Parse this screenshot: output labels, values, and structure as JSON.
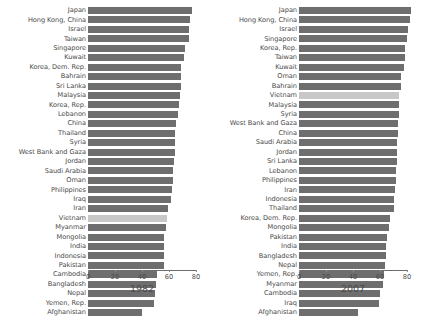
{
  "figure": {
    "panels": [
      {
        "id": "1982",
        "name": "panel-1982",
        "year_label": "1982",
        "axis": {
          "ticks": [
            "0",
            "20",
            "40",
            "60",
            "80"
          ],
          "tick_values": [
            0,
            20,
            40,
            60,
            80
          ],
          "xlim": [
            0,
            80
          ]
        },
        "highlight_country": "Vietnam"
      },
      {
        "id": "2007",
        "name": "panel-2007",
        "year_label": "2007",
        "axis": {
          "ticks": [
            "0",
            "20",
            "40",
            "60",
            "80"
          ],
          "tick_values": [
            0,
            20,
            40,
            60,
            80
          ],
          "xlim": [
            0,
            80
          ]
        },
        "highlight_country": "Vietnam"
      }
    ]
  },
  "colors": {
    "bar": "#6e6e6e",
    "bar_highlight": "#c8c8c8",
    "text": "#4a4a4a",
    "axis": "#6e6e6e",
    "background": "#ffffff"
  },
  "chart_data": [
    {
      "type": "bar",
      "orientation": "horizontal",
      "title": "1982",
      "xlabel": "",
      "ylabel": "",
      "xlim": [
        0,
        80
      ],
      "xticks": [
        0,
        20,
        40,
        60,
        80
      ],
      "grid": false,
      "legend": null,
      "highlighted": [
        "Vietnam"
      ],
      "categories": [
        "Japan",
        "Hong Kong, China",
        "Israel",
        "Taiwan",
        "Singapore",
        "Kuwait",
        "Korea, Dem. Rep.",
        "Bahrain",
        "Sri Lanka",
        "Malaysia",
        "Korea, Rep.",
        "Lebanon",
        "China",
        "Thailand",
        "Syria",
        "West Bank and Gaza",
        "Jordan",
        "Saudi Arabia",
        "Oman",
        "Philippines",
        "Iraq",
        "Iran",
        "Vietnam",
        "Myanmar",
        "Mongolia",
        "India",
        "Indonesia",
        "Pakistan",
        "Cambodia",
        "Bangladesh",
        "Nepal",
        "Yemen, Rep.",
        "Afghanistan"
      ],
      "values": [
        77.1,
        75.4,
        74.9,
        74.6,
        71.8,
        71.3,
        69.1,
        68.7,
        68.8,
        68.0,
        67.1,
        66.9,
        65.5,
        64.6,
        64.6,
        64.4,
        63.7,
        63.0,
        62.7,
        62.1,
        61.4,
        59.6,
        58.8,
        58.1,
        56.6,
        56.6,
        56.2,
        56.2,
        50.9,
        50.0,
        49.6,
        49.1,
        39.9
      ]
    },
    {
      "type": "bar",
      "orientation": "horizontal",
      "title": "2007",
      "xlabel": "",
      "ylabel": "",
      "xlim": [
        0,
        80
      ],
      "xticks": [
        0,
        20,
        40,
        60,
        80
      ],
      "grid": false,
      "legend": null,
      "highlighted": [
        "Vietnam"
      ],
      "categories": [
        "Japan",
        "Hong Kong, China",
        "Israel",
        "Singapore",
        "Korea, Rep.",
        "Taiwan",
        "Kuwait",
        "Oman",
        "Bahrain",
        "Vietnam",
        "Malaysia",
        "Syria",
        "West Bank and Gaza",
        "China",
        "Saudi Arabia",
        "Jordan",
        "Sri Lanka",
        "Lebanon",
        "Philippines",
        "Iran",
        "Indonesia",
        "Thailand",
        "Korea, Dem. Rep.",
        "Mongolia",
        "Pakistan",
        "India",
        "Bangladesh",
        "Nepal",
        "Yemen, Rep.",
        "Myanmar",
        "Cambodia",
        "Iraq",
        "Afghanistan"
      ],
      "values": [
        82.6,
        82.2,
        80.7,
        80.0,
        78.6,
        78.4,
        77.6,
        75.6,
        75.6,
        74.2,
        74.2,
        74.1,
        73.4,
        73.0,
        72.8,
        72.5,
        72.4,
        71.9,
        71.7,
        71.0,
        70.6,
        70.6,
        67.3,
        66.8,
        65.5,
        64.7,
        64.1,
        63.8,
        62.7,
        62.1,
        59.7,
        59.5,
        43.8
      ]
    }
  ]
}
